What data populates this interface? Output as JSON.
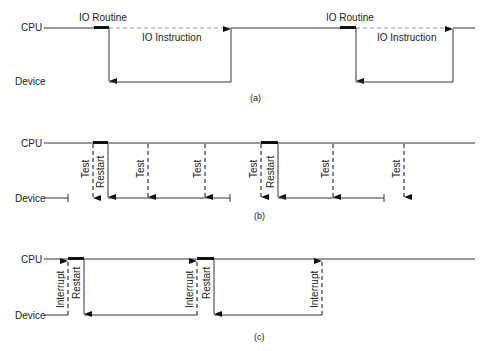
{
  "labels": {
    "cpu": "CPU",
    "device": "Device"
  },
  "panel_a": {
    "caption": "(a)",
    "io_routine": "IO Routine",
    "io_instruction": "IO Instruction"
  },
  "panel_b": {
    "caption": "(b)",
    "test": "Test",
    "restart": "Restart"
  },
  "panel_c": {
    "caption": "(c)",
    "interrupt": "Interrupt",
    "restart": "Restart"
  }
}
